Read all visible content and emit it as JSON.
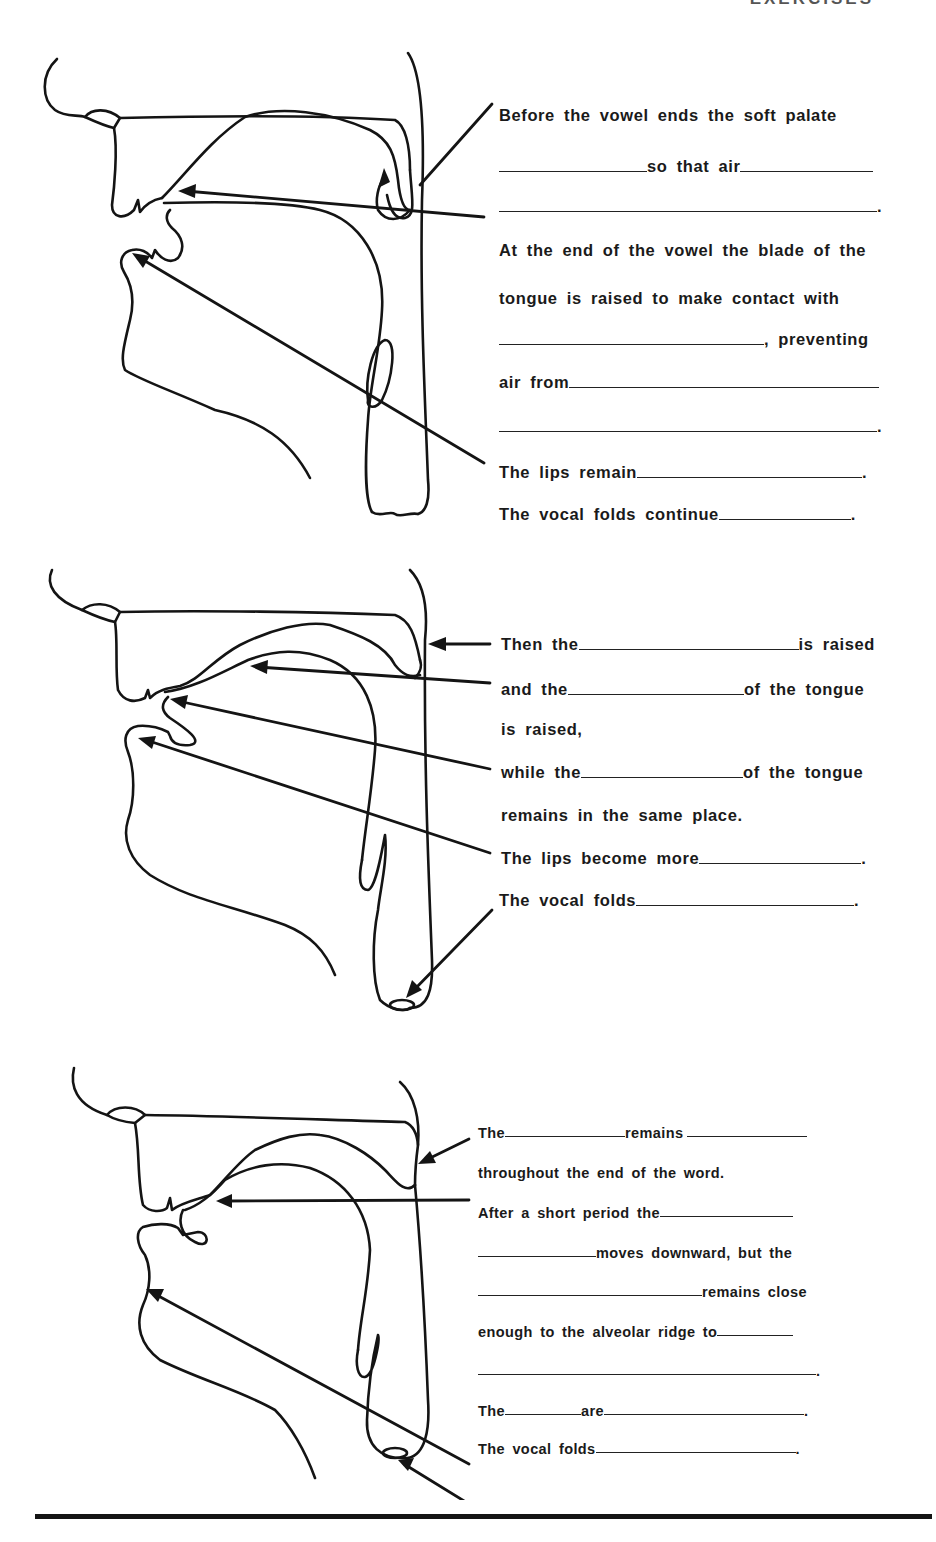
{
  "page": {
    "header": "EXERCISES",
    "bottom_rule": true
  },
  "diagrams": [
    {
      "id": "diagram-1",
      "description": "Sagittal vocal tract: soft palate lowering, tongue blade at alveolar ridge, lips, vocal folds",
      "arrows": [
        "soft-palate",
        "tongue-blade",
        "lips"
      ]
    },
    {
      "id": "diagram-2",
      "description": "Sagittal vocal tract: velum raised, tongue back raised, tongue blade held, lips, vocal folds",
      "arrows": [
        "velum",
        "tongue-back",
        "tongue-blade",
        "lips",
        "vocal-folds"
      ]
    },
    {
      "id": "diagram-3",
      "description": "Sagittal vocal tract: velum remains raised, tongue moves down, lips, vocal folds",
      "arrows": [
        "velum",
        "tongue",
        "lips",
        "vocal-folds"
      ]
    }
  ],
  "exercise1": {
    "lines": [
      {
        "segments": [
          "Before the vowel ends the soft palate"
        ]
      },
      {
        "segments": [
          "",
          "so that air",
          ""
        ]
      },
      {
        "segments": [
          "",
          "."
        ]
      },
      {
        "segments": [
          "At the end of the vowel the blade of the"
        ]
      },
      {
        "segments": [
          "tongue is raised to make contact with"
        ]
      },
      {
        "segments": [
          "",
          ", preventing"
        ]
      },
      {
        "segments": [
          "air from",
          ""
        ]
      },
      {
        "segments": [
          "",
          "."
        ]
      },
      {
        "segments": [
          "The lips remain",
          "",
          "."
        ]
      },
      {
        "segments": [
          "The vocal folds continue",
          "",
          "."
        ]
      }
    ]
  },
  "exercise2": {
    "lines": [
      {
        "segments": [
          "Then the",
          "",
          "is raised"
        ]
      },
      {
        "segments": [
          "and the",
          "",
          "of the tongue"
        ]
      },
      {
        "segments": [
          "is raised,"
        ]
      },
      {
        "segments": [
          "while the",
          "",
          "of the tongue"
        ]
      },
      {
        "segments": [
          "remains in the same place."
        ]
      },
      {
        "segments": [
          "The lips become more",
          "",
          "."
        ]
      },
      {
        "segments": [
          "The vocal folds ",
          "",
          "."
        ]
      }
    ]
  },
  "exercise3": {
    "lines": [
      {
        "segments": [
          "The",
          "",
          "remains",
          ""
        ]
      },
      {
        "segments": [
          "throughout the end of the word."
        ]
      },
      {
        "segments": [
          "After a short period the",
          ""
        ]
      },
      {
        "segments": [
          "",
          "moves downward, but the"
        ]
      },
      {
        "segments": [
          "",
          "remains close"
        ]
      },
      {
        "segments": [
          "enough to the alveolar ridge to",
          ""
        ]
      },
      {
        "segments": [
          "",
          "."
        ]
      },
      {
        "segments": [
          "The",
          "",
          "are",
          "",
          "."
        ]
      },
      {
        "segments": [
          "The vocal folds ",
          "",
          "."
        ]
      }
    ]
  }
}
